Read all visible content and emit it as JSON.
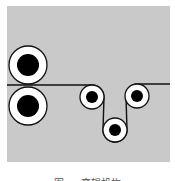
{
  "figure": {
    "background": "#c9c9c9",
    "line_color": "#111111",
    "web_line_y": 85,
    "rollers": [
      {
        "name": "large-roller-top",
        "cx": 28,
        "cy": 65,
        "r_outer": 19,
        "r_inner": 11
      },
      {
        "name": "large-roller-bottom",
        "cx": 28,
        "cy": 106,
        "r_outer": 19,
        "r_inner": 11
      },
      {
        "name": "small-roller-left",
        "cx": 92,
        "cy": 97,
        "r_outer": 12,
        "r_inner": 6
      },
      {
        "name": "small-roller-bottom",
        "cx": 115,
        "cy": 130,
        "r_outer": 12,
        "r_inner": 6
      },
      {
        "name": "small-roller-right",
        "cx": 137,
        "cy": 96,
        "r_outer": 12,
        "r_inner": 6
      }
    ]
  },
  "caption": {
    "text": "图 … 弯辊机构"
  }
}
